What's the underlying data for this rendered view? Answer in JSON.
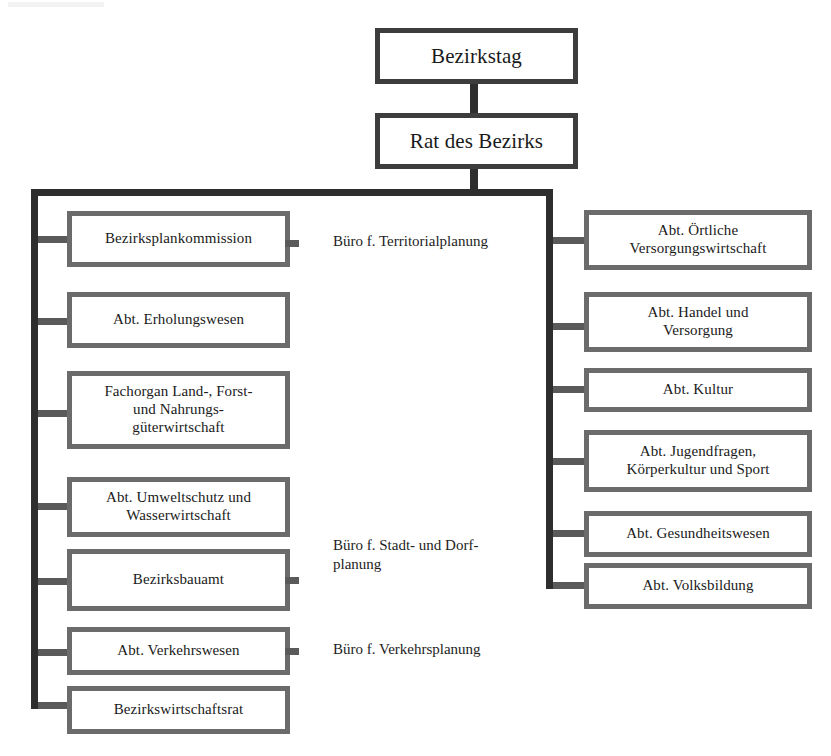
{
  "diagram": {
    "top": [
      {
        "id": "bezirkstag",
        "label": "Bezirkstag"
      },
      {
        "id": "rat-des-bezirks",
        "label": "Rat des Bezirks"
      }
    ],
    "left_branch": [
      {
        "id": "bezirksplankommission",
        "label": "Bezirksplankommission"
      },
      {
        "id": "abt-erholungswesen",
        "label": "Abt. Erholungswesen"
      },
      {
        "id": "fachorgan-land-forst",
        "label": "Fachorgan Land-, Forst-\nund Nahrungs-\ngüterwirtschaft"
      },
      {
        "id": "abt-umweltschutz",
        "label": "Abt.  Umweltschutz und\nWasserwirtschaft"
      },
      {
        "id": "bezirksbauamt",
        "label": "Bezirksbauamt"
      },
      {
        "id": "abt-verkehrswesen",
        "label": "Abt. Verkehrswesen"
      },
      {
        "id": "bezirkswirtschaftsrat",
        "label": "Bezirkswirtschaftsrat"
      }
    ],
    "right_branch": [
      {
        "id": "abt-oertliche-versorgungswirtschaft",
        "label": "Abt. Örtliche\nVersorgungswirtschaft"
      },
      {
        "id": "abt-handel-und-versorgung",
        "label": "Abt. Handel und\nVersorgung"
      },
      {
        "id": "abt-kultur",
        "label": "Abt. Kultur"
      },
      {
        "id": "abt-jugendfragen",
        "label": "Abt. Jugendfragen,\nKörperkultur und Sport"
      },
      {
        "id": "abt-gesundheitswesen",
        "label": "Abt. Gesundheitswesen"
      },
      {
        "id": "abt-volksbildung",
        "label": "Abt. Volksbildung"
      }
    ],
    "center_labels": [
      {
        "id": "buero-territorialplanung",
        "label": "Büro f. Territorialplanung"
      },
      {
        "id": "buero-stadt-und-dorfplanung",
        "label": "Büro f. Stadt- und  Dorf-\nplanung"
      },
      {
        "id": "buero-verkehrsplanung",
        "label": "Büro f. Verkehrsplanung"
      }
    ],
    "colors": {
      "box_border": "#6b6b6b",
      "box_border_dark": "#3d3d3d",
      "connector": "#5a5a5a",
      "connector_dark": "#2e2e2e",
      "text": "#1a1a1a",
      "background": "#ffffff"
    }
  }
}
